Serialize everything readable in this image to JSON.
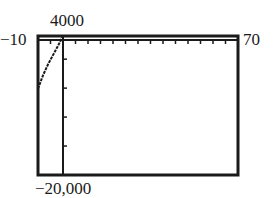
{
  "chart_data": {
    "type": "line",
    "title": "",
    "xlabel": "",
    "ylabel": "",
    "xlim": [
      -10,
      70
    ],
    "ylim": [
      -20000,
      4000
    ],
    "window_labels": {
      "xmin": "−10",
      "xmax": "70",
      "ymax": "4000",
      "ymin": "−20,000"
    },
    "x_tick_step": 5,
    "y_tick_step": 5000,
    "grid": false,
    "legend": null,
    "series": [
      {
        "name": "y",
        "x": [
          -10,
          -8,
          -6,
          -4,
          -2,
          0,
          2,
          4,
          6,
          8,
          10,
          14,
          18,
          22,
          26,
          30,
          34,
          38,
          42,
          45,
          48,
          52,
          56,
          60,
          64,
          68,
          70
        ],
        "y": [
          -5100,
          -2800,
          -900,
          700,
          2300,
          4000,
          3800,
          3300,
          2500,
          1500,
          400,
          -2200,
          -5000,
          -8000,
          -10800,
          -13300,
          -15300,
          -16700,
          -17400,
          -17500,
          -17300,
          -16000,
          -12800,
          -7500,
          -1000,
          4000,
          4000
        ]
      }
    ]
  }
}
